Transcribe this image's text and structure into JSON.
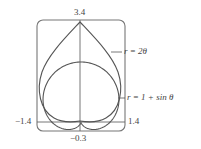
{
  "chart_data": {
    "type": "line",
    "title": "",
    "xlabel": "",
    "ylabel": "",
    "xlim": [
      -1.4,
      1.4
    ],
    "ylim": [
      -0.3,
      3.4
    ],
    "tick_labels": {
      "top": "3.4",
      "bottom": "−0.3",
      "left": "−1.4",
      "right": "1.4"
    },
    "series": [
      {
        "name": "r = 2θ",
        "label": "r = 2θ",
        "shape": "teardrop with cusp at (0, 3.4) and base at origin"
      },
      {
        "name": "r = 1 + sin θ",
        "label": "r = 1 + sin θ",
        "equation": "r = 1 + sin(theta)",
        "theta_range": [
          0,
          6.2832
        ]
      }
    ],
    "grid": false,
    "frame": "rounded viewing rectangle",
    "line_color": "#555555"
  },
  "colors": {
    "stroke": "#555555",
    "frame": "#777777",
    "text": "#444444"
  }
}
